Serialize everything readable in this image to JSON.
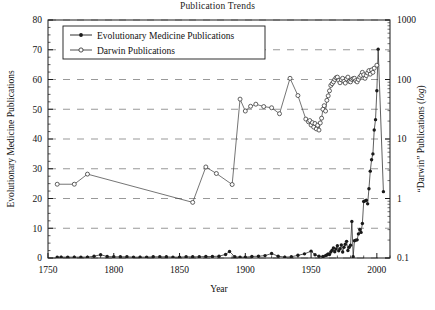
{
  "chart_data": {
    "type": "line",
    "title": "Publication Trends",
    "xlabel": "Year",
    "ylabel": "Evolutionary Medicine Publications",
    "y2label_prefix": "“Darwin” Publications (",
    "y2label_italic": "log",
    "y2label_suffix": ")",
    "xlim": [
      1750,
      2010
    ],
    "ylim": [
      0,
      80
    ],
    "y2lim_log": [
      0.1,
      1000
    ],
    "grid": "horizontal-dashed",
    "legend_position": "top-left-inside",
    "xticks": [
      1750,
      1800,
      1850,
      1900,
      1950,
      2000
    ],
    "yticks": [
      0,
      10,
      20,
      30,
      40,
      50,
      60,
      70,
      80
    ],
    "y2ticks": [
      "0.1",
      "1",
      "10",
      "100",
      "1000"
    ],
    "series": [
      {
        "name": "Evolutionary Medicine Publications",
        "marker": "filled-circle",
        "axis": "left",
        "points": [
          [
            1757,
            0.3
          ],
          [
            1760,
            0.3
          ],
          [
            1765,
            0.3
          ],
          [
            1770,
            0.3
          ],
          [
            1775,
            0.3
          ],
          [
            1780,
            0.3
          ],
          [
            1785,
            0.6
          ],
          [
            1790,
            1.1
          ],
          [
            1795,
            0.5
          ],
          [
            1800,
            0.4
          ],
          [
            1805,
            0.4
          ],
          [
            1810,
            0.4
          ],
          [
            1815,
            0.3
          ],
          [
            1820,
            0.3
          ],
          [
            1825,
            0.3
          ],
          [
            1830,
            0.4
          ],
          [
            1835,
            0.4
          ],
          [
            1840,
            0.4
          ],
          [
            1845,
            0.3
          ],
          [
            1850,
            0.3
          ],
          [
            1855,
            0.4
          ],
          [
            1860,
            0.4
          ],
          [
            1865,
            0.4
          ],
          [
            1870,
            0.5
          ],
          [
            1875,
            0.5
          ],
          [
            1880,
            0.6
          ],
          [
            1885,
            1.2
          ],
          [
            1888,
            2.2
          ],
          [
            1892,
            0.4
          ],
          [
            1896,
            0.3
          ],
          [
            1900,
            0.3
          ],
          [
            1905,
            0.5
          ],
          [
            1910,
            0.6
          ],
          [
            1915,
            0.8
          ],
          [
            1920,
            1.5
          ],
          [
            1925,
            0.6
          ],
          [
            1930,
            0.3
          ],
          [
            1935,
            0.4
          ],
          [
            1940,
            0.9
          ],
          [
            1945,
            1.4
          ],
          [
            1950,
            2.3
          ],
          [
            1953,
            1.1
          ],
          [
            1956,
            0.6
          ],
          [
            1959,
            0.5
          ],
          [
            1961,
            0.8
          ],
          [
            1962,
            1.0
          ],
          [
            1963,
            1.4
          ],
          [
            1964,
            1.2
          ],
          [
            1965,
            2.0
          ],
          [
            1966,
            2.6
          ],
          [
            1967,
            3.4
          ],
          [
            1968,
            2.1
          ],
          [
            1969,
            3.0
          ],
          [
            1970,
            4.1
          ],
          [
            1971,
            2.4
          ],
          [
            1972,
            3.1
          ],
          [
            1973,
            4.4
          ],
          [
            1974,
            2.0
          ],
          [
            1975,
            3.6
          ],
          [
            1976,
            4.6
          ],
          [
            1977,
            5.6
          ],
          [
            1978,
            2.5
          ],
          [
            1979,
            3.6
          ],
          [
            1980,
            4.3
          ],
          [
            1981,
            12.3
          ],
          [
            1982,
            0.4
          ],
          [
            1983,
            5.8
          ],
          [
            1984,
            6.0
          ],
          [
            1985,
            6.1
          ],
          [
            1986,
            8.1
          ],
          [
            1987,
            9.6
          ],
          [
            1988,
            8.6
          ],
          [
            1989,
            11.6
          ],
          [
            1990,
            19.0
          ],
          [
            1991,
            19.2
          ],
          [
            1992,
            19.4
          ],
          [
            1993,
            18.2
          ],
          [
            1994,
            23.3
          ],
          [
            1995,
            29.2
          ],
          [
            1996,
            33.0
          ],
          [
            1997,
            35.0
          ],
          [
            1998,
            43.0
          ],
          [
            1999,
            46.5
          ],
          [
            2000,
            56.2
          ],
          [
            2001,
            70.2
          ],
          [
            2005,
            22.3
          ]
        ]
      },
      {
        "name": "Darwin Publications",
        "marker": "open-circle",
        "axis": "right-log",
        "points": [
          [
            1757,
            24.8
          ],
          [
            1770,
            24.8
          ],
          [
            1780,
            28.2
          ],
          [
            1860,
            18.7
          ],
          [
            1870,
            30.6
          ],
          [
            1878,
            28.4
          ],
          [
            1890,
            24.7
          ],
          [
            1896,
            53.4
          ],
          [
            1900,
            49.4
          ],
          [
            1904,
            51.0
          ],
          [
            1908,
            51.7
          ],
          [
            1914,
            50.9
          ],
          [
            1920,
            50.5
          ],
          [
            1926,
            48.5
          ],
          [
            1934,
            60.4
          ],
          [
            1940,
            54.6
          ],
          [
            1946,
            46.7
          ],
          [
            1948,
            45.8
          ],
          [
            1949,
            46.2
          ],
          [
            1950,
            44.7
          ],
          [
            1951,
            45.5
          ],
          [
            1952,
            44.0
          ],
          [
            1953,
            45.2
          ],
          [
            1954,
            43.4
          ],
          [
            1955,
            44.6
          ],
          [
            1956,
            43.0
          ],
          [
            1957,
            45.4
          ],
          [
            1958,
            47.0
          ],
          [
            1959,
            50.0
          ],
          [
            1960,
            51.2
          ],
          [
            1961,
            49.4
          ],
          [
            1962,
            53.0
          ],
          [
            1963,
            54.5
          ],
          [
            1964,
            56.2
          ],
          [
            1965,
            58.0
          ],
          [
            1966,
            58.6
          ],
          [
            1967,
            59.2
          ],
          [
            1968,
            60.0
          ],
          [
            1969,
            60.6
          ],
          [
            1970,
            60.8
          ],
          [
            1971,
            59.7
          ],
          [
            1972,
            58.9
          ],
          [
            1973,
            59.9
          ],
          [
            1974,
            60.4
          ],
          [
            1975,
            59.4
          ],
          [
            1976,
            58.8
          ],
          [
            1977,
            60.2
          ],
          [
            1978,
            60.8
          ],
          [
            1979,
            59.4
          ],
          [
            1980,
            59.2
          ],
          [
            1981,
            60.0
          ],
          [
            1982,
            60.3
          ],
          [
            1983,
            60.4
          ],
          [
            1984,
            59.6
          ],
          [
            1985,
            59.2
          ],
          [
            1986,
            60.0
          ],
          [
            1987,
            60.8
          ],
          [
            1988,
            61.4
          ],
          [
            1989,
            62.4
          ],
          [
            1990,
            61.6
          ],
          [
            1991,
            60.4
          ],
          [
            1992,
            61.3
          ],
          [
            1993,
            62.2
          ],
          [
            1994,
            63.0
          ],
          [
            1995,
            61.8
          ],
          [
            1996,
            63.2
          ],
          [
            1997,
            62.4
          ],
          [
            1998,
            63.8
          ],
          [
            2000,
            64.8
          ]
        ]
      }
    ]
  }
}
